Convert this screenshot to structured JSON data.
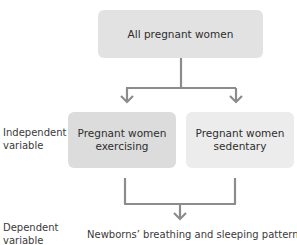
{
  "diagram": {
    "top_box": {
      "label": "All pregnant women"
    },
    "branches": [
      {
        "label_line1": "Pregnant women",
        "label_line2": "exercising"
      },
      {
        "label_line1": "Pregnant women",
        "label_line2": "sedentary"
      }
    ],
    "outcome": {
      "label": "Newborns’ breathing and sleeping patterns"
    },
    "side_labels": {
      "independent": {
        "line1": "Independent",
        "line2": "variable"
      },
      "dependent": {
        "line1": "Dependent",
        "line2": "variable"
      }
    },
    "colors": {
      "top_box": "#e2e2e2",
      "left_box": "#dcdcdc",
      "right_box": "#ececec",
      "connector": "#8c8c8c"
    }
  }
}
